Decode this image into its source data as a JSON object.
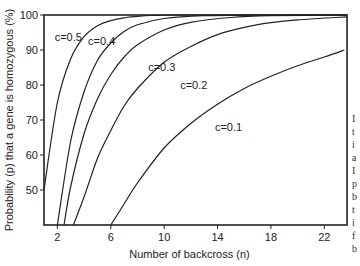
{
  "chart_data": {
    "type": "line",
    "title": "",
    "xlabel": "Number of backcross (n)",
    "ylabel": "Probability (p) that a gene is homozygous (%)",
    "xlim": [
      1,
      23.7
    ],
    "ylim": [
      40,
      100
    ],
    "x_ticks": [
      2,
      6,
      10,
      14,
      18,
      22
    ],
    "y_ticks": [
      50,
      60,
      70,
      80,
      90,
      100
    ],
    "grid": false,
    "legend": "inline curve labels",
    "series": [
      {
        "name": "c=0.5",
        "points": [
          [
            1,
            50
          ],
          [
            2,
            75
          ],
          [
            3,
            87.5
          ],
          [
            4,
            93.8
          ],
          [
            5,
            96.9
          ],
          [
            6,
            98.4
          ],
          [
            7,
            99.2
          ],
          [
            8,
            99.6
          ],
          [
            11,
            100
          ],
          [
            23.7,
            100
          ]
        ]
      },
      {
        "name": "c=0.4",
        "points": [
          [
            2,
            40
          ],
          [
            3,
            64
          ],
          [
            4,
            78
          ],
          [
            5,
            87
          ],
          [
            6,
            92
          ],
          [
            7,
            95.3
          ],
          [
            8,
            97.2
          ],
          [
            10,
            99
          ],
          [
            13,
            99.8
          ],
          [
            17,
            100
          ],
          [
            23.7,
            100
          ]
        ]
      },
      {
        "name": "c=0.3",
        "points": [
          [
            2.5,
            40
          ],
          [
            3,
            51
          ],
          [
            4,
            66
          ],
          [
            5,
            76
          ],
          [
            6,
            83
          ],
          [
            7,
            88
          ],
          [
            8,
            91.5
          ],
          [
            10,
            95.7
          ],
          [
            12,
            97.9
          ],
          [
            15,
            99.3
          ],
          [
            18,
            99.8
          ],
          [
            23.7,
            100
          ]
        ]
      },
      {
        "name": "c=0.2",
        "points": [
          [
            3.2,
            40
          ],
          [
            4,
            48
          ],
          [
            5,
            59
          ],
          [
            6,
            67
          ],
          [
            7,
            74
          ],
          [
            8,
            79
          ],
          [
            10,
            86.5
          ],
          [
            12,
            91
          ],
          [
            14,
            94.4
          ],
          [
            16,
            96.5
          ],
          [
            18,
            97.8
          ],
          [
            20,
            98.6
          ],
          [
            23.7,
            99.5
          ]
        ]
      },
      {
        "name": "c=0.1",
        "points": [
          [
            6,
            40
          ],
          [
            7,
            46
          ],
          [
            8,
            52
          ],
          [
            10,
            62
          ],
          [
            12,
            69
          ],
          [
            14,
            74.5
          ],
          [
            16,
            79
          ],
          [
            18,
            82.5
          ],
          [
            20,
            85.5
          ],
          [
            22,
            88
          ],
          [
            23.5,
            90
          ]
        ]
      }
    ],
    "annotations": [
      {
        "text": "c=0.5",
        "n": 1.8,
        "p": 92.5
      },
      {
        "text": "c=0.4",
        "n": 4.3,
        "p": 91.5
      },
      {
        "text": "c=0.3",
        "n": 8.8,
        "p": 84
      },
      {
        "text": "c=0.2",
        "n": 11.2,
        "p": 79
      },
      {
        "text": "c=0.1",
        "n": 13.8,
        "p": 67
      }
    ]
  },
  "clipped_side_text": [
    "I",
    "t",
    "i",
    "a",
    "I",
    "p",
    "b",
    "t",
    "i",
    "f",
    "b"
  ],
  "style": {
    "line_color": "#222222",
    "axis_color": "#222222",
    "background": "#ffffff"
  }
}
